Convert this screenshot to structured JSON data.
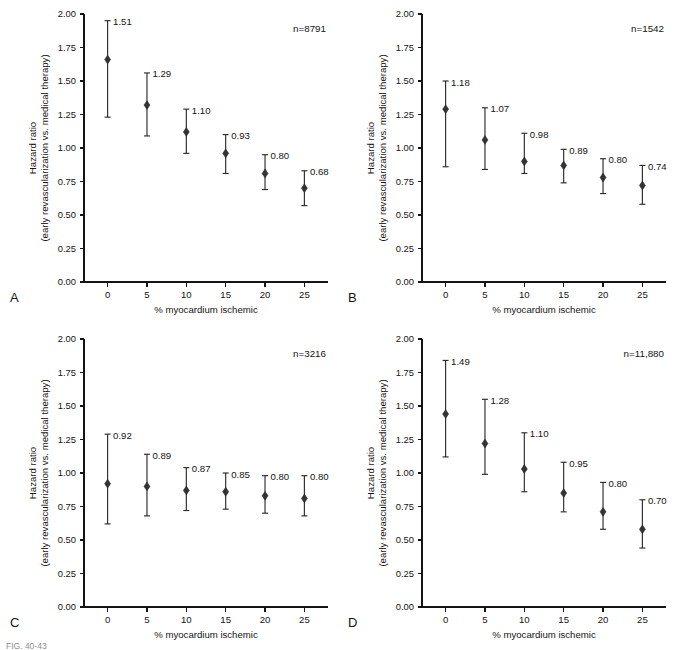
{
  "figure": {
    "caption_fragment": "FIG. 40-43",
    "panel_letters": [
      "A",
      "B",
      "C",
      "D"
    ]
  },
  "axes": {
    "xlabel": "% myocardium ischemic",
    "ylabel_line1": "Hazard ratio",
    "ylabel_line2": "(early revascularization vs. medical therapy)",
    "ytick_labels": [
      "0.00",
      "0.25",
      "0.50",
      "0.75",
      "1.00",
      "1.25",
      "1.50",
      "1.75",
      "2.00"
    ],
    "ytick_values": [
      0,
      0.25,
      0.5,
      0.75,
      1.0,
      1.25,
      1.5,
      1.75,
      2.0
    ],
    "xtick_labels": [
      "0",
      "5",
      "10",
      "15",
      "20",
      "25"
    ],
    "xtick_values": [
      0,
      5,
      10,
      15,
      20,
      25
    ],
    "ylim": [
      0,
      2.0
    ],
    "xlim": [
      -3,
      28
    ],
    "grid": false
  },
  "colors": {
    "marker": "#333333",
    "errorbar": "#2b2b2b",
    "axis": "#141414",
    "background": "#ffffff"
  },
  "chart_data": [
    {
      "type": "scatter",
      "panel": "A",
      "n_label": "n=8791",
      "n": 8791,
      "title": "",
      "xlabel": "% myocardium ischemic",
      "ylabel": "Hazard ratio (early revascularization vs. medical therapy)",
      "xlim": [
        -3,
        28
      ],
      "ylim": [
        0,
        2.0
      ],
      "x": [
        0,
        5,
        10,
        15,
        20,
        25
      ],
      "values": [
        1.66,
        1.32,
        1.12,
        0.96,
        0.81,
        0.7
      ],
      "ci_low": [
        1.23,
        1.09,
        0.96,
        0.81,
        0.69,
        0.57
      ],
      "ci_high": [
        1.95,
        1.56,
        1.29,
        1.1,
        0.95,
        0.83
      ],
      "labels": [
        "1.51",
        "1.29",
        "1.10",
        "0.93",
        "0.80",
        "0.68"
      ]
    },
    {
      "type": "scatter",
      "panel": "B",
      "n_label": "n=1542",
      "n": 1542,
      "title": "",
      "xlabel": "% myocardium ischemic",
      "ylabel": "Hazard ratio (early revascularization vs. medical therapy)",
      "xlim": [
        -3,
        28
      ],
      "ylim": [
        0,
        2.0
      ],
      "x": [
        0,
        5,
        10,
        15,
        20,
        25
      ],
      "values": [
        1.29,
        1.06,
        0.9,
        0.87,
        0.78,
        0.72
      ],
      "ci_low": [
        0.86,
        0.84,
        0.81,
        0.74,
        0.66,
        0.58
      ],
      "ci_high": [
        1.5,
        1.3,
        1.11,
        0.99,
        0.92,
        0.87
      ],
      "labels": [
        "1.18",
        "1.07",
        "0.98",
        "0.89",
        "0.80",
        "0.74"
      ]
    },
    {
      "type": "scatter",
      "panel": "C",
      "n_label": "n=3216",
      "n": 3216,
      "title": "",
      "xlabel": "% myocardium ischemic",
      "ylabel": "Hazard ratio (early revascularization vs. medical therapy)",
      "xlim": [
        -3,
        28
      ],
      "ylim": [
        0,
        2.0
      ],
      "x": [
        0,
        5,
        10,
        15,
        20,
        25
      ],
      "values": [
        0.92,
        0.9,
        0.87,
        0.86,
        0.83,
        0.81
      ],
      "ci_low": [
        0.62,
        0.68,
        0.72,
        0.73,
        0.7,
        0.68
      ],
      "ci_high": [
        1.29,
        1.14,
        1.04,
        1.0,
        0.98,
        0.98
      ],
      "labels": [
        "0.92",
        "0.89",
        "0.87",
        "0.85",
        "0.80",
        "0.80"
      ]
    },
    {
      "type": "scatter",
      "panel": "D",
      "n_label": "n=11,880",
      "n": 11880,
      "title": "",
      "xlabel": "% myocardium ischemic",
      "ylabel": "Hazard ratio (early revascularization vs. medical therapy)",
      "xlim": [
        -3,
        28
      ],
      "ylim": [
        0,
        2.0
      ],
      "x": [
        0,
        5,
        10,
        15,
        20,
        25
      ],
      "values": [
        1.44,
        1.22,
        1.03,
        0.85,
        0.71,
        0.58
      ],
      "ci_low": [
        1.12,
        0.99,
        0.86,
        0.71,
        0.58,
        0.44
      ],
      "ci_high": [
        1.84,
        1.55,
        1.3,
        1.08,
        0.93,
        0.8
      ],
      "labels": [
        "1.49",
        "1.28",
        "1.10",
        "0.95",
        "0.80",
        "0.70"
      ]
    }
  ]
}
